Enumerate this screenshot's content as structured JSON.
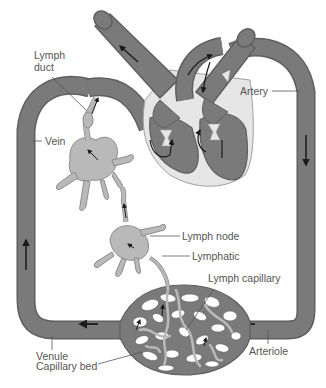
{
  "diagram": {
    "colors": {
      "vessel": "#7a7a7a",
      "vessel_outline": "#5f5f5f",
      "lymph": "#b9b9b9",
      "lymph_outline": "#8c8c8c",
      "heart_wall": "#e6e6e6",
      "arrow": "#1a1a1a",
      "label_text": "#555555",
      "leader_line": "#555555"
    },
    "labels": {
      "lymph_duct_line1": "Lymph",
      "lymph_duct_line2": "duct",
      "vein": "Vein",
      "artery": "Artery",
      "lymph_node": "Lymph node",
      "lymphatic": "Lymphatic",
      "lymph_capillary": "Lymph capillary",
      "venule": "Venule",
      "capillary_bed": "Capillary bed",
      "arteriole": "Arteriole"
    }
  }
}
